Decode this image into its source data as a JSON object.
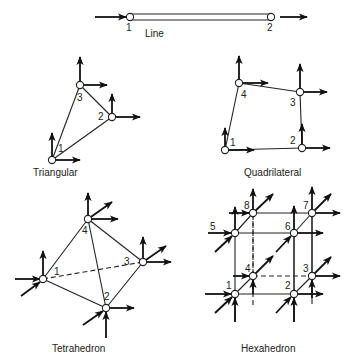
{
  "figure": {
    "ink_color": "#222222",
    "background": "#ffffff",
    "elements": [
      {
        "id": "line",
        "caption": "Line",
        "caption_pos": [
          145,
          37
        ],
        "nodes": [
          {
            "label": "1",
            "pos": [
              130,
              17
            ],
            "label_pos": [
              126,
              31
            ]
          },
          {
            "label": "2",
            "pos": [
              271,
              17
            ],
            "label_pos": [
              267,
              31
            ]
          }
        ],
        "edges": [],
        "bar": {
          "x1": 130,
          "x2": 271,
          "y": 17,
          "h": 6
        },
        "arrows": [
          {
            "from": [
              95,
              17
            ],
            "to": [
              126,
              17
            ]
          },
          {
            "from": [
              280,
              17
            ],
            "to": [
              307,
              17
            ]
          }
        ]
      },
      {
        "id": "triangular",
        "caption": "Triangular",
        "caption_pos": [
          33,
          176
        ],
        "nodes": [
          {
            "label": "1",
            "pos": [
              52,
              160
            ],
            "label_pos": [
              58,
              152
            ]
          },
          {
            "label": "2",
            "pos": [
              112,
              117
            ],
            "label_pos": [
              98,
              120
            ]
          },
          {
            "label": "3",
            "pos": [
              80,
              85
            ],
            "label_pos": [
              77,
              101
            ]
          }
        ],
        "edges": [
          {
            "a": 0,
            "b": 1
          },
          {
            "a": 1,
            "b": 2
          },
          {
            "a": 2,
            "b": 0
          }
        ],
        "arrows": [
          {
            "from": [
              52,
              160
            ],
            "to": [
              52,
              133
            ]
          },
          {
            "from": [
              52,
              160
            ],
            "to": [
              80,
              160
            ]
          },
          {
            "from": [
              112,
              117
            ],
            "to": [
              112,
              94
            ]
          },
          {
            "from": [
              112,
              117
            ],
            "to": [
              140,
              117
            ]
          },
          {
            "from": [
              80,
              85
            ],
            "to": [
              80,
              57
            ]
          },
          {
            "from": [
              80,
              85
            ],
            "to": [
              107,
              85
            ]
          }
        ]
      },
      {
        "id": "quadrilateral",
        "caption": "Quadrilateral",
        "caption_pos": [
          244,
          176
        ],
        "nodes": [
          {
            "label": "1",
            "pos": [
              225,
              150
            ],
            "label_pos": [
              230,
              146
            ]
          },
          {
            "label": "2",
            "pos": [
              302,
              148
            ],
            "label_pos": [
              290,
              144
            ]
          },
          {
            "label": "3",
            "pos": [
              300,
              92
            ],
            "label_pos": [
              290,
              106
            ]
          },
          {
            "label": "4",
            "pos": [
              239,
              83
            ],
            "label_pos": [
              241,
              98
            ]
          }
        ],
        "edges": [
          {
            "a": 0,
            "b": 1
          },
          {
            "a": 1,
            "b": 2
          },
          {
            "a": 2,
            "b": 3
          },
          {
            "a": 3,
            "b": 0
          }
        ],
        "arrows": [
          {
            "from": [
              225,
              150
            ],
            "to": [
              225,
              128
            ]
          },
          {
            "from": [
              225,
              150
            ],
            "to": [
              254,
              150
            ]
          },
          {
            "from": [
              302,
              148
            ],
            "to": [
              302,
              124
            ]
          },
          {
            "from": [
              302,
              148
            ],
            "to": [
              330,
              148
            ]
          },
          {
            "from": [
              300,
              92
            ],
            "to": [
              300,
              64
            ]
          },
          {
            "from": [
              300,
              92
            ],
            "to": [
              327,
              92
            ]
          },
          {
            "from": [
              239,
              83
            ],
            "to": [
              239,
              56
            ]
          },
          {
            "from": [
              239,
              83
            ],
            "to": [
              268,
              83
            ]
          }
        ]
      },
      {
        "id": "tetrahedron",
        "caption": "Tetrahedron",
        "caption_pos": [
          52,
          352
        ],
        "nodes": [
          {
            "label": "1",
            "pos": [
              43,
              279
            ],
            "label_pos": [
              54,
              275
            ]
          },
          {
            "label": "2",
            "pos": [
              106,
              308
            ],
            "label_pos": [
              104,
              300
            ]
          },
          {
            "label": "3",
            "pos": [
              143,
              262
            ],
            "label_pos": [
              124,
              265
            ]
          },
          {
            "label": "4",
            "pos": [
              88,
              219
            ],
            "label_pos": [
              82,
              234
            ]
          }
        ],
        "edges": [
          {
            "a": 0,
            "b": 1
          },
          {
            "a": 1,
            "b": 2
          },
          {
            "a": 0,
            "b": 3
          },
          {
            "a": 1,
            "b": 3
          },
          {
            "a": 2,
            "b": 3
          },
          {
            "a": 0,
            "b": 2,
            "dashed": true
          }
        ],
        "arrows": [
          {
            "from": [
              15,
              279
            ],
            "to": [
              40,
              279
            ]
          },
          {
            "from": [
              21,
              296
            ],
            "to": [
              40,
              282
            ]
          },
          {
            "from": [
              43,
              279
            ],
            "to": [
              43,
              251
            ]
          },
          {
            "from": [
              106,
              338
            ],
            "to": [
              106,
              312
            ]
          },
          {
            "from": [
              83,
              325
            ],
            "to": [
              103,
              311
            ]
          },
          {
            "from": [
              106,
              308
            ],
            "to": [
              134,
              308
            ]
          },
          {
            "from": [
              143,
              262
            ],
            "to": [
              143,
              237
            ]
          },
          {
            "from": [
              143,
              262
            ],
            "to": [
              171,
              262
            ]
          },
          {
            "from": [
              143,
              262
            ],
            "to": [
              166,
              246
            ]
          },
          {
            "from": [
              88,
              219
            ],
            "to": [
              88,
              193
            ]
          },
          {
            "from": [
              88,
              219
            ],
            "to": [
              118,
              219
            ]
          },
          {
            "from": [
              88,
              219
            ],
            "to": [
              112,
              202
            ]
          }
        ]
      },
      {
        "id": "hexahedron",
        "caption": "Hexahedron",
        "caption_pos": [
          241,
          352
        ],
        "nodes": [
          {
            "label": "1",
            "pos": [
              235,
              294
            ],
            "label_pos": [
              226,
              289
            ]
          },
          {
            "label": "2",
            "pos": [
              294,
              294
            ],
            "label_pos": [
              285,
              289
            ]
          },
          {
            "label": "3",
            "pos": [
              312,
              276
            ],
            "label_pos": [
              303,
              272
            ]
          },
          {
            "label": "4",
            "pos": [
              253,
              276
            ],
            "label_pos": [
              245,
              272
            ]
          },
          {
            "label": "5",
            "pos": [
              235,
              233
            ],
            "label_pos": [
              210,
              230
            ]
          },
          {
            "label": "6",
            "pos": [
              294,
              233
            ],
            "label_pos": [
              285,
              230
            ]
          },
          {
            "label": "7",
            "pos": [
              312,
              213
            ],
            "label_pos": [
              303,
              209
            ]
          },
          {
            "label": "8",
            "pos": [
              253,
              213
            ],
            "label_pos": [
              244,
              209
            ]
          }
        ],
        "edges": [
          {
            "a": 0,
            "b": 1
          },
          {
            "a": 1,
            "b": 2
          },
          {
            "a": 4,
            "b": 5
          },
          {
            "a": 5,
            "b": 6
          },
          {
            "a": 6,
            "b": 7
          },
          {
            "a": 7,
            "b": 4
          },
          {
            "a": 0,
            "b": 4
          },
          {
            "a": 1,
            "b": 5
          },
          {
            "a": 2,
            "b": 6
          },
          {
            "a": 0,
            "b": 3
          },
          {
            "a": 4,
            "b": 7
          },
          {
            "a": 3,
            "b": 2,
            "dashed": true
          },
          {
            "a": 3,
            "b": 7,
            "dashed": true
          }
        ],
        "arrows": [
          {
            "from": [
              205,
              294
            ],
            "to": [
              231,
              294
            ]
          },
          {
            "from": [
              215,
              313
            ],
            "to": [
              232,
              297
            ]
          },
          {
            "from": [
              235,
              322
            ],
            "to": [
              235,
              298
            ]
          },
          {
            "from": [
              276,
              313
            ],
            "to": [
              291,
              297
            ]
          },
          {
            "from": [
              294,
              322
            ],
            "to": [
              294,
              298
            ]
          },
          {
            "from": [
              294,
              294
            ],
            "to": [
              323,
              294
            ]
          },
          {
            "from": [
              312,
              298
            ],
            "to": [
              312,
              280
            ]
          },
          {
            "from": [
              312,
              276
            ],
            "to": [
              340,
              276
            ]
          },
          {
            "from": [
              312,
              276
            ],
            "to": [
              331,
              257
            ]
          },
          {
            "from": [
              233,
              276
            ],
            "to": [
              249,
              276
            ]
          },
          {
            "from": [
              253,
              294
            ],
            "to": [
              253,
              280
            ]
          },
          {
            "from": [
              253,
              276
            ],
            "to": [
              273,
              256
            ]
          },
          {
            "from": [
              208,
              233
            ],
            "to": [
              231,
              233
            ]
          },
          {
            "from": [
              215,
              252
            ],
            "to": [
              232,
              236
            ]
          },
          {
            "from": [
              235,
              233
            ],
            "to": [
              235,
              207
            ]
          },
          {
            "from": [
              276,
              252
            ],
            "to": [
              291,
              236
            ]
          },
          {
            "from": [
              294,
              233
            ],
            "to": [
              294,
              206
            ]
          },
          {
            "from": [
              294,
              233
            ],
            "to": [
              323,
              233
            ]
          },
          {
            "from": [
              312,
              213
            ],
            "to": [
              312,
              187
            ]
          },
          {
            "from": [
              312,
              213
            ],
            "to": [
              340,
              213
            ]
          },
          {
            "from": [
              312,
              213
            ],
            "to": [
              331,
              194
            ]
          },
          {
            "from": [
              229,
              213
            ],
            "to": [
              249,
              213
            ]
          },
          {
            "from": [
              253,
              213
            ],
            "to": [
              253,
              189
            ]
          },
          {
            "from": [
              253,
              213
            ],
            "to": [
              273,
              194
            ]
          }
        ],
        "extra_lines": [
          {
            "from": [
              235,
              294
            ],
            "to": [
              235,
              322
            ]
          },
          {
            "from": [
              294,
              294
            ],
            "to": [
              294,
              322
            ]
          },
          {
            "from": [
              312,
              276
            ],
            "to": [
              312,
              304
            ]
          },
          {
            "from": [
              253,
              276
            ],
            "to": [
              253,
              305
            ],
            "dashed": true
          },
          {
            "from": [
              312,
              213
            ],
            "to": [
              312,
              276
            ]
          },
          {
            "from": [
              294,
              233
            ],
            "to": [
              294,
              294
            ]
          },
          {
            "from": [
              253,
              213
            ],
            "to": [
              253,
              276
            ],
            "dashed": true
          }
        ]
      }
    ]
  }
}
